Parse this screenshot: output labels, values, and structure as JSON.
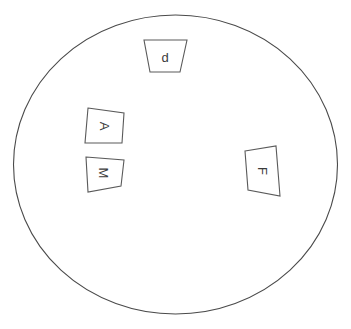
{
  "figure": {
    "type": "diagram",
    "background_color": "#ffffff",
    "stroke_color": "#4a4a4a",
    "label_color": "#3b3b3b",
    "arena": {
      "name": "circular-arena",
      "shape": "circle",
      "center_x": 175.5,
      "center_y": 164.5,
      "radius_x": 162,
      "radius_y": 149.5
    },
    "markers": [
      {
        "id": "marker-d",
        "label": "d",
        "rotation": 0,
        "points": "144,40 187,40 180,72 150,72",
        "label_x": 165,
        "label_y": 57
      },
      {
        "id": "marker-a",
        "label": "A",
        "rotation": 90,
        "points": "88,108 124,113 122,143 85,143",
        "label_x": 104,
        "label_y": 126
      },
      {
        "id": "marker-m",
        "label": "M",
        "rotation": 90,
        "points": "86,157 124,160 121,186 88,192",
        "label_x": 103,
        "label_y": 173
      },
      {
        "id": "marker-f",
        "label": "F",
        "rotation": 90,
        "points": "245,151 276,146 280,196 248,190",
        "label_x": 262,
        "label_y": 171
      }
    ]
  }
}
